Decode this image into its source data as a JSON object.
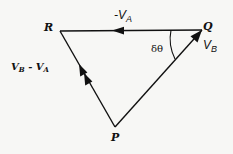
{
  "diagram": {
    "type": "vector-triangle",
    "vertices": {
      "R": {
        "label": "R",
        "x": 60,
        "y": 31
      },
      "Q": {
        "label": "Q",
        "x": 202,
        "y": 30
      },
      "P": {
        "label": "P",
        "x": 115,
        "y": 127
      }
    },
    "edges": [
      {
        "from": "Q",
        "to": "R",
        "label": "-V",
        "label_sub": "A",
        "arrowheads": 1
      },
      {
        "from": "P",
        "to": "Q",
        "label": "V",
        "label_sub": "B",
        "arrowheads": 1
      },
      {
        "from": "P",
        "to": "R",
        "label": "V",
        "label_sub": "B",
        "label_mid": " - V",
        "label_sub2": "A",
        "arrowheads": 2
      }
    ],
    "angle": {
      "at": "Q",
      "label": "δθ"
    },
    "colors": {
      "line": "#111111",
      "background": "#f7f7f5"
    }
  },
  "labels": {
    "R": "R",
    "Q": "Q",
    "P": "P",
    "neg_va_prefix": "-V",
    "neg_va_sub": "A",
    "vb": "V",
    "vb_sub": "B",
    "diff_v1": "V",
    "diff_sub1": "B",
    "diff_mid": " - V",
    "diff_sub2": "A",
    "angle": "δθ"
  }
}
